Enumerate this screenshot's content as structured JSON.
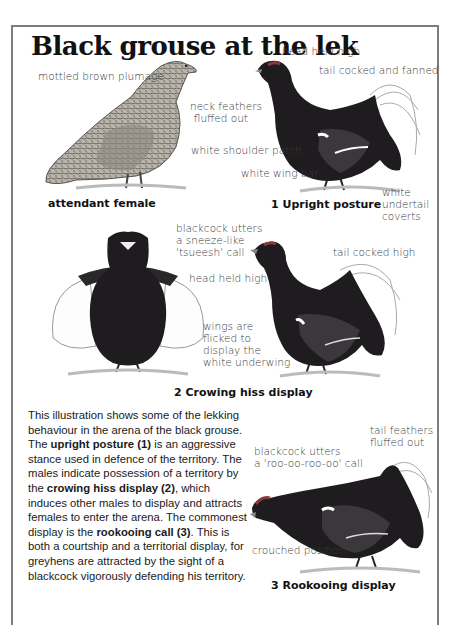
{
  "page": {
    "title": "Black grouse at the lek",
    "frame_color": "#7d7d7d"
  },
  "figures": {
    "female": {
      "caption": "attendant female",
      "labels": {
        "plumage": "mottled brown plumage"
      }
    },
    "upright": {
      "caption": "1  Upright posture",
      "labels": {
        "head": "head held high",
        "tail": "tail cocked and fanned",
        "neck_1": "neck feathers",
        "neck_2": "fluffed out",
        "shoulder": "white shoulder patch",
        "wingbar": "white wing bar",
        "undertail_1": "white",
        "undertail_2": "undertail",
        "undertail_3": "coverts"
      }
    },
    "crowing": {
      "caption": "2  Crowing hiss display",
      "labels": {
        "call_1": "blackcock utters",
        "call_2": "a sneeze-like",
        "call_3": "'tsueesh' call",
        "head": "head held high",
        "tail": "tail cocked high",
        "wings_1": "wings are",
        "wings_2": "flicked to",
        "wings_3": "display the",
        "wings_4": "white underwing"
      }
    },
    "rookooing": {
      "caption": "3  Rookooing display",
      "labels": {
        "tail_1": "tail feathers",
        "tail_2": "fluffed out",
        "call_1": "blackcock utters",
        "call_2": "a 'roo-oo-roo-oo' call",
        "crouch": "crouched position"
      }
    }
  },
  "body_text": {
    "s1": "This illustration shows some of the lekking behaviour in the arena of the black grouse. The ",
    "b1": "upright posture (1)",
    "s2": " is an aggressive stance used in defence of the territory. The males indicate possession of a territory by the ",
    "b2": "crowing hiss display (2)",
    "s3": ", which induces other males to display and attracts females to enter the arena. The commonest display is the ",
    "b3": "rookooing call (3)",
    "s4": ". This is both a courtship and a territorial display, for greyhens are attracted by the sight of a blackcock vigorously defending his territory."
  }
}
